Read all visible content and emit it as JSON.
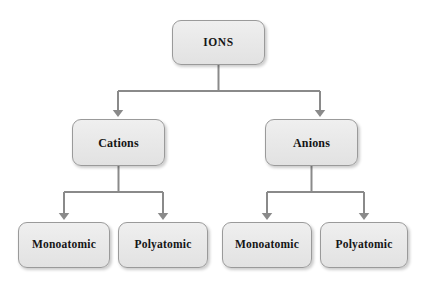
{
  "diagram": {
    "type": "hierarchy-tree",
    "background_color": "#ffffff",
    "node_fill_color": "#e9e9e9",
    "node_border_color": "#9a9a9a",
    "connector_color": "#8a8a8a",
    "text_color": "#151515"
  },
  "nodes": {
    "root": {
      "label": "IONS"
    },
    "level2": [
      {
        "label": "Cations"
      },
      {
        "label": "Anions"
      }
    ],
    "level3": [
      {
        "label": "Monoatomic"
      },
      {
        "label": "Polyatomic"
      },
      {
        "label": "Monoatomic"
      },
      {
        "label": "Polyatomic"
      }
    ]
  }
}
